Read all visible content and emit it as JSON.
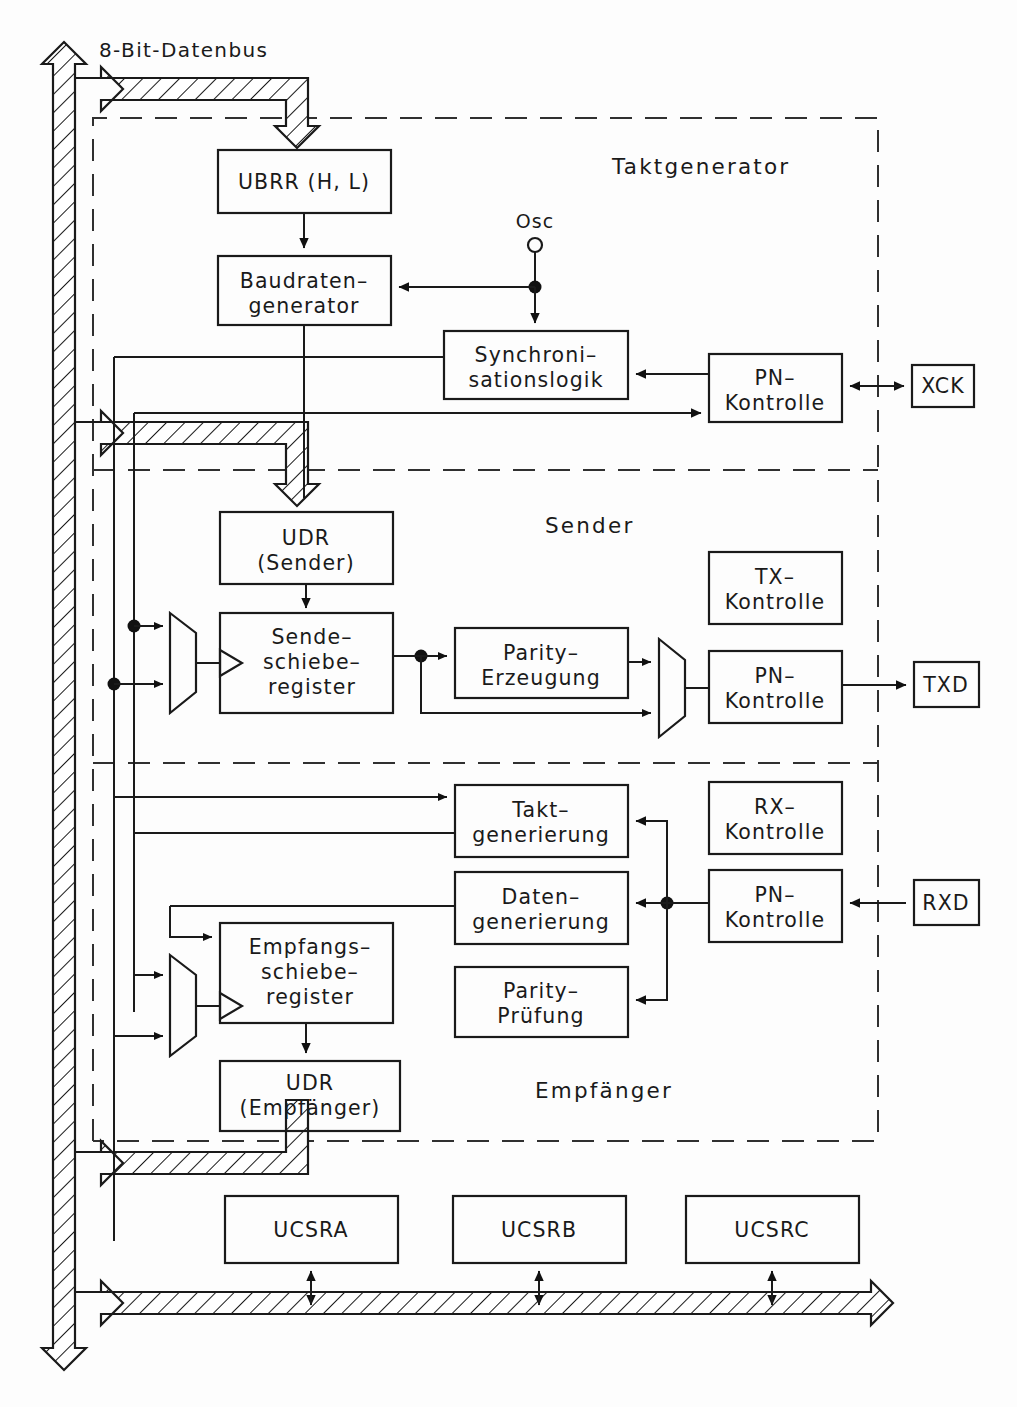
{
  "diagram": {
    "title": "8-Bit-Datenbus",
    "bus_label": "8-Bit-Datenbus",
    "sections": [
      {
        "id": "taktgenerator",
        "label": "Taktgenerator"
      },
      {
        "id": "sender",
        "label": "Sender"
      },
      {
        "id": "empfaenger",
        "label": "Empfänger"
      }
    ],
    "blocks": {
      "ubrr": {
        "line1": "UBRR (H, L)"
      },
      "baudraten": {
        "line1": "Baudraten–",
        "line2": "generator"
      },
      "sync": {
        "line1": "Synchroni–",
        "line2": "sationslogik"
      },
      "pn_takt": {
        "line1": "PN–",
        "line2": "Kontrolle"
      },
      "udr_sender": {
        "line1": "UDR",
        "line2": "(Sender)"
      },
      "sendeschiebe": {
        "line1": "Sende–",
        "line2": "schiebe–",
        "line3": "register"
      },
      "parity_erz": {
        "line1": "Parity–",
        "line2": "Erzeugung"
      },
      "tx_kontrolle": {
        "line1": "TX–",
        "line2": "Kontrolle"
      },
      "pn_sender": {
        "line1": "PN–",
        "line2": "Kontrolle"
      },
      "takt_gen": {
        "line1": "Takt–",
        "line2": "generierung"
      },
      "rx_kontrolle": {
        "line1": "RX–",
        "line2": "Kontrolle"
      },
      "daten_gen": {
        "line1": "Daten–",
        "line2": "generierung"
      },
      "pn_empf": {
        "line1": "PN–",
        "line2": "Kontrolle"
      },
      "parity_pruef": {
        "line1": "Parity–",
        "line2": "Prüfung"
      },
      "empfangsschiebe": {
        "line1": "Empfangs–",
        "line2": "schiebe–",
        "line3": "register"
      },
      "udr_empf": {
        "line1": "UDR",
        "line2": "(Empfänger)"
      },
      "ucsra": {
        "line1": "UCSRA"
      },
      "ucsrb": {
        "line1": "UCSRB"
      },
      "ucsrc": {
        "line1": "UCSRC"
      }
    },
    "pins": {
      "osc": "Osc",
      "xck": "XCK",
      "txd": "TXD",
      "rxd": "RXD"
    },
    "colors": {
      "stroke": "#1a1a1a",
      "dashed": "#303030",
      "background": "#fdfdfd"
    }
  }
}
